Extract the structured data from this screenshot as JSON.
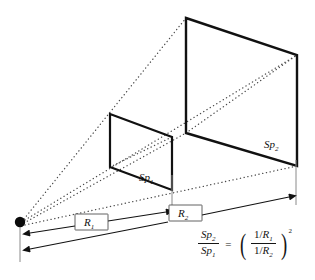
{
  "figure": {
    "type": "geometric-diagram",
    "background_color": "#ffffff",
    "line_color": "#111111",
    "dotted_color": "#555555"
  },
  "labels": {
    "plane1": "Sp",
    "plane1_sub": "1",
    "plane2": "Sp",
    "plane2_sub": "2",
    "distance1": "R",
    "distance1_sub": "1",
    "distance2": "R",
    "distance2_sub": "2"
  },
  "formula": {
    "lhs_num": "Sp",
    "lhs_num_sub": "2",
    "lhs_den": "Sp",
    "lhs_den_sub": "1",
    "equals": "=",
    "rhs_num_prefix": "1/",
    "rhs_num": "R",
    "rhs_num_sub": "1",
    "rhs_den_prefix": "1/",
    "rhs_den": "R",
    "rhs_den_sub": "2",
    "exponent": "2",
    "paren_open": "(",
    "paren_close": ")"
  },
  "geometry": {
    "origin_point": {
      "x": 20,
      "y": 222,
      "radius": 5
    },
    "plane1": {
      "tl": [
        110,
        114
      ],
      "tr": [
        172,
        137
      ],
      "br": [
        172,
        190
      ],
      "bl": [
        110,
        167
      ]
    },
    "plane2": {
      "tl": [
        186,
        18
      ],
      "tr": [
        297,
        55
      ],
      "br": [
        297,
        166
      ],
      "bl": [
        186,
        133
      ]
    },
    "dim_line_1": {
      "from": [
        22,
        234
      ],
      "to": [
        172,
        211
      ]
    },
    "dim_line_2": {
      "from": [
        22,
        250
      ],
      "to": [
        295,
        196
      ]
    }
  }
}
